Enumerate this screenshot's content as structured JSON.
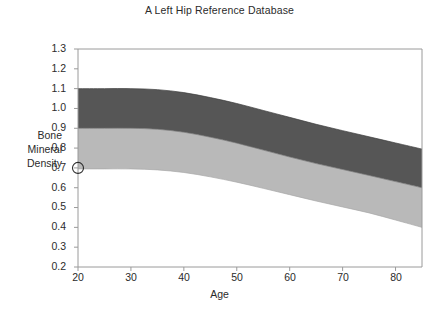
{
  "chart_data": {
    "type": "area",
    "title": "A Left Hip Reference Database",
    "xlabel": "Age",
    "ylabel": "Bone Mineral Density",
    "xlim": [
      20,
      85
    ],
    "ylim": [
      0.2,
      1.3
    ],
    "xticks": [
      20,
      30,
      40,
      50,
      60,
      70,
      80
    ],
    "yticks": [
      0.2,
      0.3,
      0.4,
      0.5,
      0.6,
      0.7,
      0.8,
      0.9,
      1.0,
      1.1,
      1.2,
      1.3
    ],
    "grid": false,
    "legend": null,
    "x": [
      20,
      25,
      30,
      35,
      40,
      45,
      50,
      55,
      60,
      65,
      70,
      75,
      80,
      85
    ],
    "bands": [
      {
        "name": "upper-band",
        "color": "#565656",
        "upper_values": [
          1.1,
          1.1,
          1.1,
          1.095,
          1.08,
          1.055,
          1.025,
          0.99,
          0.955,
          0.92,
          0.888,
          0.857,
          0.826,
          0.795
        ],
        "lower_values": [
          0.9,
          0.9,
          0.9,
          0.895,
          0.88,
          0.855,
          0.825,
          0.79,
          0.755,
          0.722,
          0.692,
          0.662,
          0.631,
          0.6
        ]
      },
      {
        "name": "lower-band",
        "color": "#b9b9b9",
        "upper_values": [
          0.9,
          0.9,
          0.9,
          0.895,
          0.88,
          0.855,
          0.825,
          0.79,
          0.755,
          0.722,
          0.692,
          0.662,
          0.631,
          0.6
        ],
        "lower_values": [
          0.695,
          0.695,
          0.695,
          0.69,
          0.677,
          0.655,
          0.628,
          0.597,
          0.565,
          0.533,
          0.503,
          0.473,
          0.437,
          0.4
        ]
      }
    ],
    "markers": [
      {
        "name": "patient-point",
        "x": 20,
        "y": 0.7,
        "style": "open-circle"
      }
    ],
    "colors": {
      "band_dark": "#565656",
      "band_light": "#b9b9b9",
      "axis": "#9a9a9a",
      "text": "#2b2b2b",
      "background": "#ffffff"
    }
  },
  "axis": {
    "y_tick_labels": [
      "1.3",
      "1.2",
      "1.1",
      "1.0",
      "0.9",
      "0.8",
      "0.7",
      "0.6",
      "0.5",
      "0.4",
      "0.3",
      "0.2"
    ],
    "x_tick_labels": [
      "20",
      "30",
      "40",
      "50",
      "60",
      "70",
      "80"
    ],
    "y_title_lines": [
      "Bone",
      "Mineral",
      "Density"
    ]
  }
}
